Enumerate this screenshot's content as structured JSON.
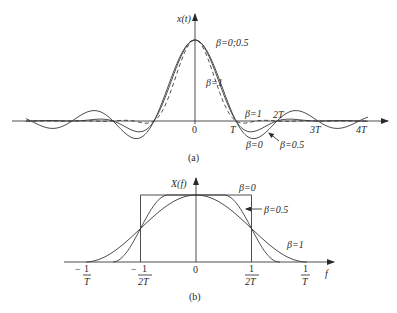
{
  "panel_a": {
    "caption": "(a)",
    "y_axis_label": "x(t)",
    "x_ticks": [
      "0",
      "T",
      "2T",
      "3T",
      "4T"
    ],
    "annotations": {
      "beta_0_05": "β=0;0.5",
      "beta_1_main": "β=1",
      "beta_1_tail": "β=1",
      "beta_0_tail": "β=0",
      "beta_05_tail": "β=0.5"
    }
  },
  "panel_b": {
    "caption": "(b)",
    "y_axis_label": "X(f)",
    "x_axis_label": "f",
    "x_ticks": [
      {
        "num": "1",
        "den": "T",
        "sign": "−"
      },
      {
        "num": "1",
        "den": "2T",
        "sign": "−"
      },
      {
        "num": "",
        "den": "",
        "sign": "",
        "plain": "0"
      },
      {
        "num": "1",
        "den": "2T",
        "sign": ""
      },
      {
        "num": "1",
        "den": "T",
        "sign": ""
      }
    ],
    "annotations": {
      "beta_0": "β=0",
      "beta_05": "β=0.5",
      "beta_1": "β=1"
    }
  },
  "chart_data": [
    {
      "type": "line",
      "title": "Raised-cosine pulse, time domain (a)",
      "xlabel": "t",
      "ylabel": "x(t)",
      "x_ticks": [
        "0",
        "T",
        "2T",
        "3T",
        "4T"
      ],
      "series": [
        {
          "name": "β=0",
          "style": "solid",
          "formula": "sinc(t/T)"
        },
        {
          "name": "β=0.5",
          "style": "solid",
          "formula": "sinc(t/T)·cos(πβt/T)/(1−4β²t²/T²)"
        },
        {
          "name": "β=1",
          "style": "dashed",
          "formula": "sinc(t/T)·cos(πt/T)/(1−4t²/T²)"
        }
      ],
      "xlim": [
        "-4.5T",
        "4.5T"
      ],
      "ylim": [
        -0.25,
        1.0
      ]
    },
    {
      "type": "line",
      "title": "Raised-cosine spectrum, frequency domain (b)",
      "xlabel": "f",
      "ylabel": "X(f)",
      "x_ticks": [
        "-1/T",
        "-1/(2T)",
        "0",
        "1/(2T)",
        "1/T"
      ],
      "series": [
        {
          "name": "β=0",
          "shape": "rectangle from -1/(2T) to 1/(2T)"
        },
        {
          "name": "β=0.5",
          "shape": "flat to 1/(4T), cosine roll-off to 3/(4T)"
        },
        {
          "name": "β=1",
          "shape": "cosine roll-off from 0 to 1/T"
        }
      ],
      "xlim": [
        "-1.2/T",
        "1.2/T"
      ],
      "ylim": [
        0,
        1
      ]
    }
  ],
  "params": {
    "a": {
      "x0": 195,
      "y0": 121,
      "T": 41,
      "amp": 81,
      "xmin": 26,
      "xmax": 368,
      "betas": [
        0,
        0.5,
        1
      ]
    },
    "b": {
      "x0": 196,
      "y0": 262,
      "half": 55.5,
      "amp": 67,
      "xmin": 68,
      "xmax": 336
    }
  }
}
